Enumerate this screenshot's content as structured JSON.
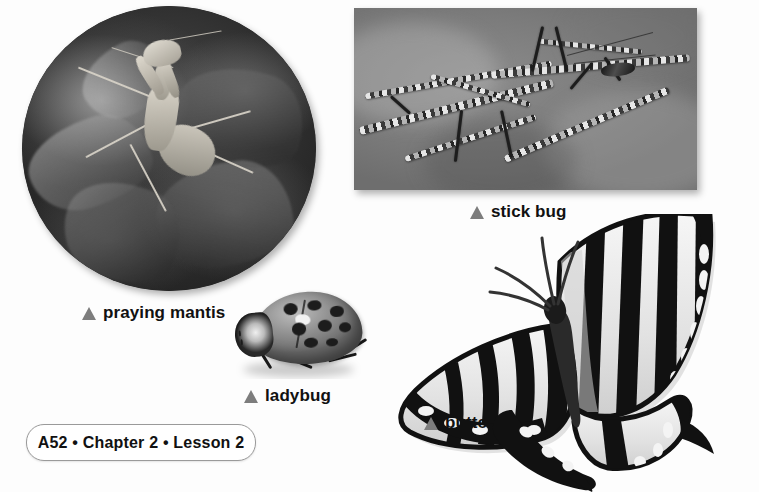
{
  "page": {
    "background_color": "#fdfdfd",
    "footer": {
      "text": "A52 • Chapter 2 • Lesson 2",
      "page_number": "A52",
      "chapter": "Chapter 2",
      "lesson": "Lesson 2",
      "border_color": "#9a9a9a"
    }
  },
  "captions": {
    "marker_color": "#7d7d7d",
    "text_color": "#111111",
    "mantis": "praying mantis",
    "stickbug": "stick bug",
    "ladybug": "ladybug",
    "butterfly": "butterfly"
  },
  "photos": [
    {
      "id": "praying-mantis",
      "shape": "circle",
      "subject": "praying mantis on leaves",
      "style": "black-and-white photograph",
      "caption": "praying mantis"
    },
    {
      "id": "stick-bug",
      "shape": "rectangle",
      "subject": "stick bug camouflaged on twigs",
      "style": "black-and-white photograph",
      "caption": "stick bug"
    },
    {
      "id": "ladybug",
      "shape": "cutout",
      "subject": "ladybug with spotted shell",
      "style": "black-and-white photograph",
      "caption": "ladybug"
    },
    {
      "id": "butterfly",
      "shape": "cutout",
      "subject": "swallowtail butterfly with striped wings",
      "style": "black-and-white photograph",
      "caption": "butterfly"
    }
  ]
}
